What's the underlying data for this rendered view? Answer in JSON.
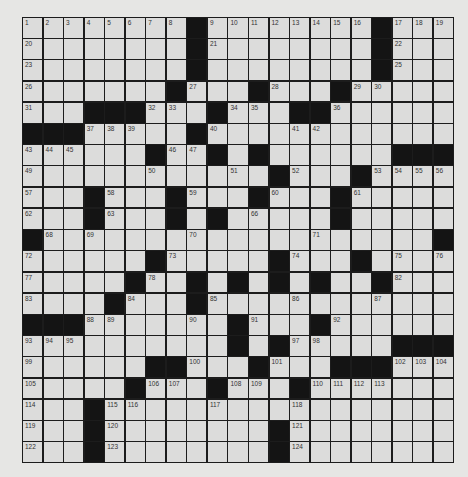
{
  "puzzle": {
    "size": {
      "rows": 21,
      "cols": 21
    },
    "colors": {
      "cell": "#dcdcdb",
      "block": "#141414",
      "line": "#1c1c1c",
      "background": "#e6e6e4"
    },
    "grid": [
      "........#........#...",
      "........#........#...",
      "........#........#...",
      ".......#...#...#.....",
      "...###...#...##......",
      "###.....#............",
      "......#..#.#......###",
      "............#...#....",
      "...#...#...#...#.....",
      "...#...#.#.....#.....",
      "#...................#",
      "......#.....#...#....",
      ".....#..#.#.#.#..#...",
      "....#...#............",
      "###.......#...#......",
      "..........#.#.....###",
      "......##...#...###...",
      ".....#...#...#.......",
      "...#.................",
      "...#........#........",
      "...#........#........"
    ],
    "numbers": {
      "0,0": "1",
      "0,1": "2",
      "0,2": "3",
      "0,3": "4",
      "0,4": "5",
      "0,5": "6",
      "0,6": "7",
      "0,7": "8",
      "0,9": "9",
      "0,10": "10",
      "0,11": "11",
      "0,12": "12",
      "0,13": "13",
      "0,14": "14",
      "0,15": "15",
      "0,16": "16",
      "0,18": "17",
      "0,19": "18",
      "0,20": "19",
      "1,0": "20",
      "1,9": "21",
      "1,18": "22",
      "2,0": "23",
      "2,8": "24",
      "2,18": "25",
      "3,0": "26",
      "3,8": "27",
      "3,12": "28",
      "3,16": "29",
      "3,17": "30",
      "4,0": "31",
      "4,6": "32",
      "4,7": "33",
      "4,10": "34",
      "4,11": "35",
      "4,15": "36",
      "5,3": "37",
      "5,4": "38",
      "5,5": "39",
      "5,9": "40",
      "5,13": "41",
      "5,14": "42",
      "6,0": "43",
      "6,1": "44",
      "6,2": "45",
      "6,7": "46",
      "6,8": "47",
      "6,11": "48",
      "7,0": "49",
      "7,6": "50",
      "7,10": "51",
      "7,13": "52",
      "7,17": "53",
      "7,18": "54",
      "7,19": "55",
      "7,20": "56",
      "8,0": "57",
      "8,4": "58",
      "8,8": "59",
      "8,12": "60",
      "8,16": "61",
      "9,0": "62",
      "9,4": "63",
      "9,7": "64",
      "9,9": "65",
      "9,11": "66",
      "9,15": "67",
      "10,1": "68",
      "10,3": "69",
      "10,8": "70",
      "10,14": "71",
      "11,0": "72",
      "11,7": "73",
      "11,13": "74",
      "11,18": "75",
      "11,20": "76",
      "12,0": "77",
      "12,6": "78",
      "12,10": "79",
      "12,12": "80",
      "12,14": "81",
      "12,18": "82",
      "13,0": "83",
      "13,5": "84",
      "13,9": "85",
      "13,13": "86",
      "13,17": "87",
      "14,3": "88",
      "14,4": "89",
      "14,8": "90",
      "14,11": "91",
      "14,15": "92",
      "15,0": "93",
      "15,1": "94",
      "15,2": "95",
      "15,10": "96",
      "15,13": "97",
      "15,14": "98",
      "16,0": "99",
      "16,8": "100",
      "16,12": "101",
      "16,18": "102",
      "16,19": "103",
      "16,20": "104",
      "17,0": "105",
      "17,6": "106",
      "17,7": "107",
      "17,10": "108",
      "17,11": "109",
      "17,14": "110",
      "17,15": "111",
      "17,16": "112",
      "17,17": "113",
      "18,0": "114",
      "18,4": "115",
      "18,5": "116",
      "18,9": "117",
      "18,13": "118",
      "19,0": "119",
      "19,4": "120",
      "19,13": "121",
      "20,0": "122",
      "20,4": "123",
      "20,13": "124"
    }
  }
}
